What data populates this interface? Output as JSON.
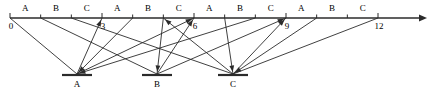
{
  "diagram": {
    "stroke_color": "#2b2b2b",
    "axis": {
      "name": "time-axis",
      "start_value": 0,
      "end_value": 12,
      "unit_step": 1,
      "x_start_px": 10,
      "x_end_px": 378,
      "y_px": 18,
      "arrow_end_px": 427,
      "tick_labels": [
        {
          "value": 0,
          "text": "0"
        },
        {
          "value": 3,
          "text": "3"
        },
        {
          "value": 6,
          "text": "6"
        },
        {
          "value": 9,
          "text": "9"
        },
        {
          "value": 12,
          "text": "12"
        }
      ],
      "slot_labels": [
        {
          "index": 0,
          "text": "A"
        },
        {
          "index": 1,
          "text": "B"
        },
        {
          "index": 2,
          "text": "C"
        },
        {
          "index": 3,
          "text": "A"
        },
        {
          "index": 4,
          "text": "B"
        },
        {
          "index": 5,
          "text": "C"
        },
        {
          "index": 6,
          "text": "A"
        },
        {
          "index": 7,
          "text": "B"
        },
        {
          "index": 8,
          "text": "C"
        },
        {
          "index": 9,
          "text": "A"
        },
        {
          "index": 10,
          "text": "B"
        },
        {
          "index": 11,
          "text": "C"
        }
      ]
    },
    "nodes": [
      {
        "id": "A",
        "label": "A",
        "x_px": 77,
        "y_px": 75,
        "bar_half_width_px": 15
      },
      {
        "id": "B",
        "label": "B",
        "x_px": 157,
        "y_px": 75,
        "bar_half_width_px": 15
      },
      {
        "id": "C",
        "label": "C",
        "x_px": 233,
        "y_px": 75,
        "bar_half_width_px": 15
      }
    ],
    "edges": [
      {
        "from_axis_value": 0,
        "to_node": "A",
        "direction": "down",
        "arrow": false
      },
      {
        "from_axis_value": 1,
        "to_node": "B",
        "direction": "down",
        "arrow": false
      },
      {
        "from_axis_value": 2,
        "to_node": "C",
        "direction": "down",
        "arrow": false
      },
      {
        "from_axis_value": 4,
        "to_node": "A",
        "direction": "down",
        "arrow": true
      },
      {
        "from_axis_value": 5,
        "to_node": "B",
        "direction": "down",
        "arrow": true
      },
      {
        "from_axis_value": 7,
        "to_node": "C",
        "direction": "down",
        "arrow": true
      },
      {
        "from_axis_value": 8,
        "to_node": "A",
        "direction": "down",
        "arrow": true
      },
      {
        "from_axis_value": 10,
        "to_node": "C",
        "direction": "down",
        "arrow": true
      },
      {
        "from_axis_value": 12,
        "to_node": "C",
        "direction": "down",
        "arrow": false
      },
      {
        "from_node": "A",
        "to_axis_value": 3,
        "direction": "up",
        "arrow": true
      },
      {
        "from_node": "A",
        "to_axis_value": 6,
        "direction": "up",
        "arrow": true
      },
      {
        "from_node": "B",
        "to_axis_value": 6,
        "direction": "up",
        "arrow": true
      },
      {
        "from_node": "B",
        "to_axis_value": 9,
        "direction": "up",
        "arrow": true
      },
      {
        "from_node": "C",
        "to_axis_value": 9,
        "direction": "up",
        "arrow": true
      },
      {
        "from_node": "C",
        "to_axis_value": 5,
        "direction": "up",
        "arrow": true
      }
    ]
  }
}
